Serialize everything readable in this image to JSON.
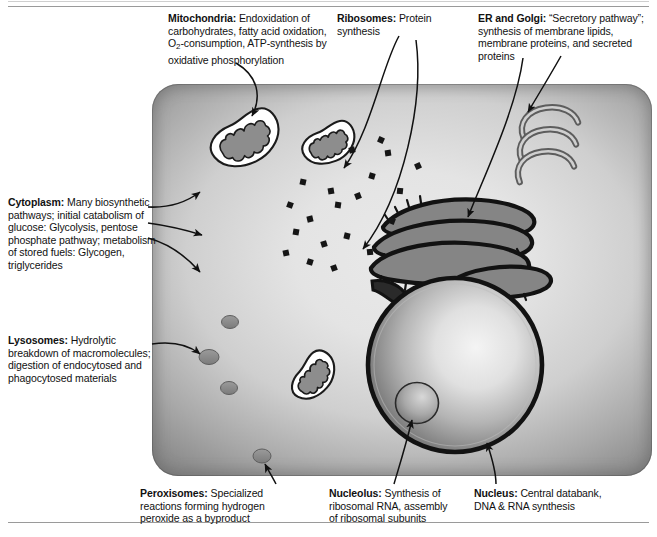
{
  "figure": {
    "colors": {
      "ink": "#111111",
      "cell_edge": "#868686",
      "cell_center": "#e9e9e9",
      "organelle_gray": "#8a8a8a",
      "outline": "#1a1a1a",
      "rule": "#9a9a9a"
    }
  },
  "labels": {
    "mitochondria": {
      "name": "Mitochondria",
      "sep": ":",
      "line1": " Endoxidation of",
      "line2": "carbohydrates, fatty acid oxidation,",
      "line3_a": "O",
      "line3_sub": "2",
      "line3_b": "-consumption, ATP-synthesis by",
      "line4": "oxidative phosphorylation"
    },
    "ribosomes": {
      "name": "Ribosomes",
      "sep": ":",
      "line1": " Protein",
      "line2": "synthesis"
    },
    "er_golgi": {
      "name": "ER and Golgi",
      "sep": ":",
      "line1": " “Secretory pathway”;",
      "line2": "synthesis of membrane lipids,",
      "line3": "membrane proteins, and secreted",
      "line4": "proteins"
    },
    "cytoplasm": {
      "name": "Cytoplasm",
      "sep": ":",
      "line1": " Many biosynthetic",
      "line2": "pathways; initial catabolism of",
      "line3": "glucose: Glycolysis, pentose",
      "line4": "phosphate pathway; metabolism",
      "line5": "of stored fuels: Glycogen,",
      "line6": "triglycerides"
    },
    "lysosomes": {
      "name": "Lysosomes",
      "sep": ":",
      "line1": " Hydrolytic",
      "line2": "breakdown of macromolecules;",
      "line3": "digestion of endocytosed and",
      "line4": "phagocytosed materials"
    },
    "peroxisomes": {
      "name": "Peroxisomes",
      "sep": ":",
      "line1": " Specialized",
      "line2": "reactions forming hydrogen",
      "line3": "peroxide as a byproduct"
    },
    "nucleolus": {
      "name": "Nucleolus",
      "sep": ":",
      "line1": " Synthesis of",
      "line2": "ribosomal RNA, assembly",
      "line3": "of ribosomal subunits"
    },
    "nucleus": {
      "name": "Nucleus",
      "sep": ":",
      "line1": " Central databank,",
      "line2": "DNA & RNA synthesis"
    }
  },
  "diagram": {
    "cell": {
      "x": 152,
      "y": 84,
      "width": 500,
      "height": 392,
      "corner_radius": 26
    },
    "organelles": [
      {
        "kind": "mitochondrion",
        "name": "mitochondrion-upper-left",
        "cx": 247,
        "cy": 141,
        "rx": 36,
        "ry": 23,
        "rotate": -33
      },
      {
        "kind": "mitochondrion",
        "name": "mitochondrion-upper-right",
        "cx": 330,
        "cy": 145,
        "rx": 27,
        "ry": 18,
        "rotate": -30
      },
      {
        "kind": "mitochondrion",
        "name": "mitochondrion-lower",
        "cx": 315,
        "cy": 377,
        "rx": 25,
        "ry": 17,
        "rotate": -56
      },
      {
        "kind": "nucleus",
        "name": "nucleus",
        "cx": 455,
        "cy": 365,
        "r": 87
      },
      {
        "kind": "nucleolus",
        "name": "nucleolus",
        "cx": 417,
        "cy": 403,
        "rx": 21,
        "ry": 20
      },
      {
        "kind": "golgi",
        "name": "golgi-apparatus",
        "cx": 552,
        "cy": 146
      },
      {
        "kind": "rough-er",
        "name": "rough-endoplasmic-reticulum",
        "cx": 455,
        "cy": 240
      },
      {
        "kind": "lysosome",
        "name": "lysosome-1",
        "cx": 230,
        "cy": 322,
        "rx": 8,
        "ry": 6
      },
      {
        "kind": "lysosome",
        "name": "lysosome-2",
        "cx": 209,
        "cy": 357,
        "rx": 10,
        "ry": 7
      },
      {
        "kind": "lysosome",
        "name": "lysosome-3",
        "cx": 229,
        "cy": 388,
        "rx": 8,
        "ry": 6
      },
      {
        "kind": "peroxisome",
        "name": "peroxisome",
        "cx": 262,
        "cy": 456,
        "rx": 9,
        "ry": 7
      }
    ],
    "free_ribosomes": [
      {
        "x": 303,
        "y": 182
      },
      {
        "x": 331,
        "y": 191
      },
      {
        "x": 290,
        "y": 205
      },
      {
        "x": 310,
        "y": 219
      },
      {
        "x": 338,
        "y": 205
      },
      {
        "x": 358,
        "y": 196
      },
      {
        "x": 372,
        "y": 176
      },
      {
        "x": 388,
        "y": 153
      },
      {
        "x": 381,
        "y": 140
      },
      {
        "x": 352,
        "y": 150
      },
      {
        "x": 296,
        "y": 232
      },
      {
        "x": 324,
        "y": 244
      },
      {
        "x": 347,
        "y": 236
      },
      {
        "x": 370,
        "y": 252
      },
      {
        "x": 392,
        "y": 221
      },
      {
        "x": 286,
        "y": 253
      },
      {
        "x": 310,
        "y": 262
      },
      {
        "x": 334,
        "y": 268
      },
      {
        "x": 400,
        "y": 191
      },
      {
        "x": 418,
        "y": 166
      }
    ],
    "arrows": [
      {
        "name": "arrow-mitochondria",
        "from": "mitochondria-label",
        "to": "mitochondrion-upper-left"
      },
      {
        "name": "arrow-ribosomes-a",
        "from": "ribosomes-label",
        "to": "free-ribosome-field"
      },
      {
        "name": "arrow-ribosomes-b",
        "from": "ribosomes-label",
        "to": "rough-er-ribosomes"
      },
      {
        "name": "arrow-er",
        "from": "er-golgi-label",
        "to": "rough-endoplasmic-reticulum"
      },
      {
        "name": "arrow-golgi",
        "from": "er-golgi-label",
        "to": "golgi-apparatus"
      },
      {
        "name": "arrow-cytoplasm-1",
        "from": "cytoplasm-label",
        "to": "cytoplasm-upper"
      },
      {
        "name": "arrow-cytoplasm-2",
        "from": "cytoplasm-label",
        "to": "cytoplasm-middle"
      },
      {
        "name": "arrow-cytoplasm-3",
        "from": "cytoplasm-label",
        "to": "cytoplasm-lower"
      },
      {
        "name": "arrow-lysosomes",
        "from": "lysosomes-label",
        "to": "lysosome-2"
      },
      {
        "name": "arrow-peroxisomes",
        "from": "peroxisomes-label",
        "to": "peroxisome"
      },
      {
        "name": "arrow-nucleolus",
        "from": "nucleolus-label",
        "to": "nucleolus"
      },
      {
        "name": "arrow-nucleus",
        "from": "nucleus-label",
        "to": "nucleus"
      }
    ]
  }
}
